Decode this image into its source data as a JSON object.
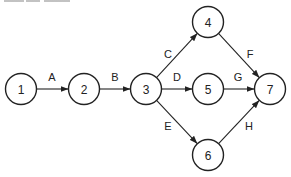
{
  "diagram": {
    "type": "activity-on-arrow network",
    "header_fragment": "",
    "nodes": [
      {
        "id": "1",
        "label": "1",
        "x": 21,
        "y": 89
      },
      {
        "id": "2",
        "label": "2",
        "x": 84,
        "y": 89
      },
      {
        "id": "3",
        "label": "3",
        "x": 146,
        "y": 89
      },
      {
        "id": "4",
        "label": "4",
        "x": 208,
        "y": 22
      },
      {
        "id": "5",
        "label": "5",
        "x": 208,
        "y": 89
      },
      {
        "id": "6",
        "label": "6",
        "x": 208,
        "y": 155
      },
      {
        "id": "7",
        "label": "7",
        "x": 270,
        "y": 89
      }
    ],
    "edges": [
      {
        "label": "A",
        "from": "1",
        "to": "2",
        "lx": 52,
        "ly": 77
      },
      {
        "label": "B",
        "from": "2",
        "to": "3",
        "lx": 115,
        "ly": 77
      },
      {
        "label": "C",
        "from": "3",
        "to": "4",
        "lx": 168,
        "ly": 54
      },
      {
        "label": "D",
        "from": "3",
        "to": "5",
        "lx": 177,
        "ly": 77
      },
      {
        "label": "E",
        "from": "3",
        "to": "6",
        "lx": 168,
        "ly": 126
      },
      {
        "label": "F",
        "from": "4",
        "to": "7",
        "lx": 250,
        "ly": 54
      },
      {
        "label": "G",
        "from": "5",
        "to": "7",
        "lx": 238,
        "ly": 77
      },
      {
        "label": "H",
        "from": "6",
        "to": "7",
        "lx": 249,
        "ly": 126
      }
    ],
    "node_radius": 15.5,
    "stroke_color": "#222222"
  }
}
